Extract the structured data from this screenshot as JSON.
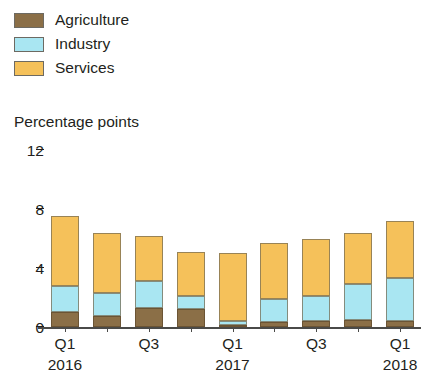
{
  "legend": {
    "items": [
      {
        "label": "Agriculture",
        "color": "#8b6f47",
        "swatch_name": "legend-swatch-agriculture"
      },
      {
        "label": "Industry",
        "color": "#a9e6f2",
        "swatch_name": "legend-swatch-industry"
      },
      {
        "label": "Services",
        "color": "#f5c15a",
        "swatch_name": "legend-swatch-services"
      }
    ]
  },
  "axis": {
    "y_title": "Percentage points",
    "y_ticks": [
      "0",
      "4",
      "8",
      "12"
    ],
    "x_quarter_labels": [
      "Q1",
      "Q3",
      "Q1",
      "Q3",
      "Q1"
    ],
    "x_year_labels": [
      "2016",
      "2017",
      "2018"
    ]
  },
  "chart_data": {
    "type": "bar",
    "title": "",
    "subtitle": "",
    "xlabel": "",
    "ylabel": "Percentage points",
    "ylim": [
      0,
      12
    ],
    "yticks": [
      0,
      4,
      8,
      12
    ],
    "grid": false,
    "stacked": true,
    "legend_position": "top-left",
    "categories": [
      "Q1 2016",
      "Q2 2016",
      "Q3 2016",
      "Q4 2016",
      "Q1 2017",
      "Q2 2017",
      "Q3 2017",
      "Q4 2017",
      "Q1 2018"
    ],
    "series": [
      {
        "name": "Agriculture",
        "color": "#8b6f47",
        "values": [
          1.0,
          0.75,
          1.3,
          1.2,
          0.15,
          0.35,
          0.4,
          0.5,
          0.4
        ]
      },
      {
        "name": "Industry",
        "color": "#a9e6f2",
        "values": [
          1.8,
          1.55,
          1.8,
          0.9,
          0.25,
          1.55,
          1.7,
          2.4,
          2.9
        ]
      },
      {
        "name": "Services",
        "color": "#f5c15a",
        "values": [
          4.7,
          4.1,
          3.1,
          3.0,
          4.6,
          3.8,
          3.9,
          3.5,
          3.9
        ]
      }
    ],
    "totals": [
      7.5,
      6.4,
      6.2,
      5.1,
      5.0,
      5.7,
      6.0,
      6.4,
      7.2
    ],
    "x_tick_labels": [
      "Q1",
      "",
      "Q3",
      "",
      "Q1",
      "",
      "Q3",
      "",
      "Q1"
    ],
    "x_year_group_labels": [
      "2016",
      "2017",
      "2018"
    ]
  }
}
